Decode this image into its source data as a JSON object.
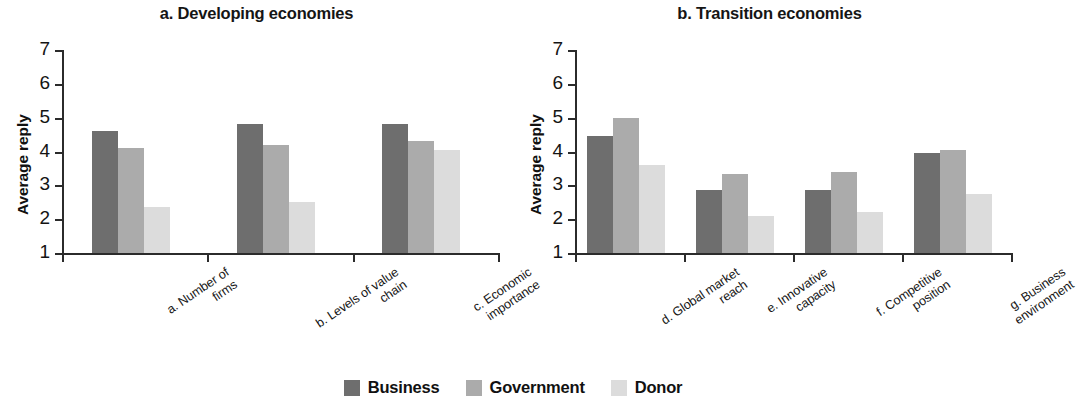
{
  "chart_data": {
    "type": "bar",
    "ylabel": "Average reply",
    "xlabel": "",
    "ylim": [
      1,
      7
    ],
    "yticks": [
      1,
      2,
      3,
      4,
      5,
      6,
      7
    ],
    "grid": false,
    "legend_position": "bottom-center",
    "series": [
      {
        "name": "Business",
        "color": "#6e6e6e"
      },
      {
        "name": "Government",
        "color": "#ababab"
      },
      {
        "name": "Donor",
        "color": "#dcdcdc"
      }
    ],
    "panels": [
      {
        "key": "a",
        "title": "a. Developing economies",
        "ylabel": "Average reply",
        "categories": [
          {
            "id": "a",
            "line1": "a. Number of",
            "line2": "firms"
          },
          {
            "id": "b",
            "line1": "b. Levels of value",
            "line2": "chain"
          },
          {
            "id": "c",
            "line1": "c. Economic",
            "line2": "importance"
          }
        ],
        "values": {
          "Business": [
            4.6,
            4.8,
            4.8
          ],
          "Government": [
            4.1,
            4.2,
            4.3
          ],
          "Donor": [
            2.35,
            2.5,
            4.05
          ]
        }
      },
      {
        "key": "b",
        "title": "b. Transition economies",
        "ylabel": "Average reply",
        "categories": [
          {
            "id": "d",
            "line1": "d. Global market",
            "line2": "reach"
          },
          {
            "id": "e",
            "line1": "e. Innovative",
            "line2": "capacity"
          },
          {
            "id": "f",
            "line1": "f. Competitive",
            "line2": "position"
          },
          {
            "id": "g",
            "line1": "g. Business",
            "line2": "environment"
          }
        ],
        "values": {
          "Business": [
            4.45,
            2.85,
            2.85,
            3.95
          ],
          "Government": [
            5.0,
            3.35,
            3.4,
            4.05
          ],
          "Donor": [
            3.6,
            2.1,
            2.2,
            2.75
          ]
        }
      }
    ]
  },
  "panel_a": {
    "title": "a. Developing economies",
    "ylabel": "Average reply"
  },
  "panel_b": {
    "title": "b. Transition economies",
    "ylabel": "Average reply"
  },
  "legend": {
    "items": [
      {
        "label": "Business",
        "color": "#6e6e6e"
      },
      {
        "label": "Government",
        "color": "#ababab"
      },
      {
        "label": "Donor",
        "color": "#dcdcdc"
      }
    ]
  }
}
